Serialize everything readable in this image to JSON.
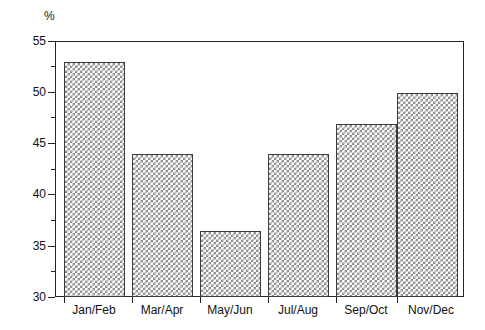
{
  "chart_data": {
    "type": "bar",
    "title": "",
    "xlabel": "",
    "ylabel": "%",
    "unit_label": "%",
    "categories": [
      "Jan/Feb",
      "Mar/Apr",
      "May/Jun",
      "Jul/Aug",
      "Sep/Oct",
      "Nov/Dec"
    ],
    "values": [
      53,
      44,
      36.5,
      44,
      47,
      50
    ],
    "ylim": [
      30,
      55
    ],
    "y_major_ticks": [
      30,
      35,
      40,
      45,
      50,
      55
    ],
    "y_major_tick_labels": [
      "30",
      "35",
      "40",
      "45",
      "50",
      "55"
    ],
    "y_minor_ticks": [
      32.5,
      37.5,
      42.5,
      47.5,
      52.5
    ],
    "grid": false,
    "legend": false,
    "bar_fill": "crosshatch",
    "bar_fill_color": "#8c8c8c",
    "bar_edge_color": "#3b3b3b",
    "axis_color": "#262626",
    "background_color": "#ffffff"
  }
}
